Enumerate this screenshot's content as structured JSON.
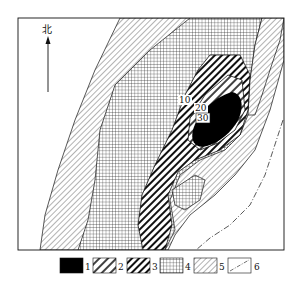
{
  "north_label": "北",
  "contours": [
    {
      "label": "10"
    },
    {
      "label": "20"
    },
    {
      "label": "30"
    }
  ],
  "legend": [
    {
      "num": "1",
      "pattern": "solid-black"
    },
    {
      "num": "2",
      "pattern": "thick-diagonal-hatch"
    },
    {
      "num": "3",
      "pattern": "bold-diagonal-hatch"
    },
    {
      "num": "4",
      "pattern": "grid-crosshatch"
    },
    {
      "num": "5",
      "pattern": "thin-diagonal-hatch"
    },
    {
      "num": "6",
      "pattern": "dash-dot-line"
    }
  ],
  "colors": {
    "ink": "#111111",
    "paper": "#ffffff"
  }
}
